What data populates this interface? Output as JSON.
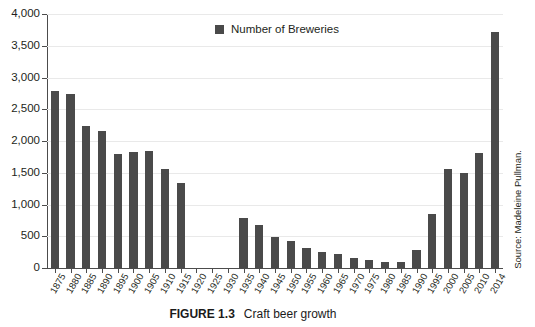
{
  "figure": {
    "caption_label": "FIGURE 1.3",
    "caption_text": "Craft beer growth",
    "source": "Source: Madeleine Pullman."
  },
  "legend": {
    "entries": [
      {
        "label": "Number of Breweries",
        "color": "#4a4a4a"
      }
    ]
  },
  "chart_data": {
    "type": "bar",
    "title": "Craft beer growth",
    "xlabel": "",
    "ylabel": "",
    "ylim": [
      0,
      4000
    ],
    "ytick_labels": [
      "0",
      "500",
      "1,000",
      "1,500",
      "2,000",
      "2,500",
      "3,000",
      "3,500",
      "4,000"
    ],
    "ytick_values": [
      0,
      500,
      1000,
      1500,
      2000,
      2500,
      3000,
      3500,
      4000
    ],
    "grid": true,
    "legend_position": "top-center",
    "bar_color": "#4a4a4a",
    "series_name": "Number of Breweries",
    "categories": [
      "1875",
      "1880",
      "1885",
      "1890",
      "1895",
      "1900",
      "1905",
      "1910",
      "1915",
      "1920",
      "1925",
      "1930",
      "1935",
      "1940",
      "1945",
      "1950",
      "1955",
      "1960",
      "1965",
      "1970",
      "1975",
      "1980",
      "1985",
      "1990",
      "1995",
      "2000",
      "2005",
      "2010",
      "2014"
    ],
    "values": [
      2780,
      2740,
      2230,
      2160,
      1790,
      1830,
      1850,
      1560,
      1345,
      0,
      0,
      0,
      780,
      680,
      490,
      420,
      320,
      260,
      220,
      165,
      120,
      95,
      95,
      290,
      850,
      1560,
      1490,
      1810,
      3710
    ]
  }
}
